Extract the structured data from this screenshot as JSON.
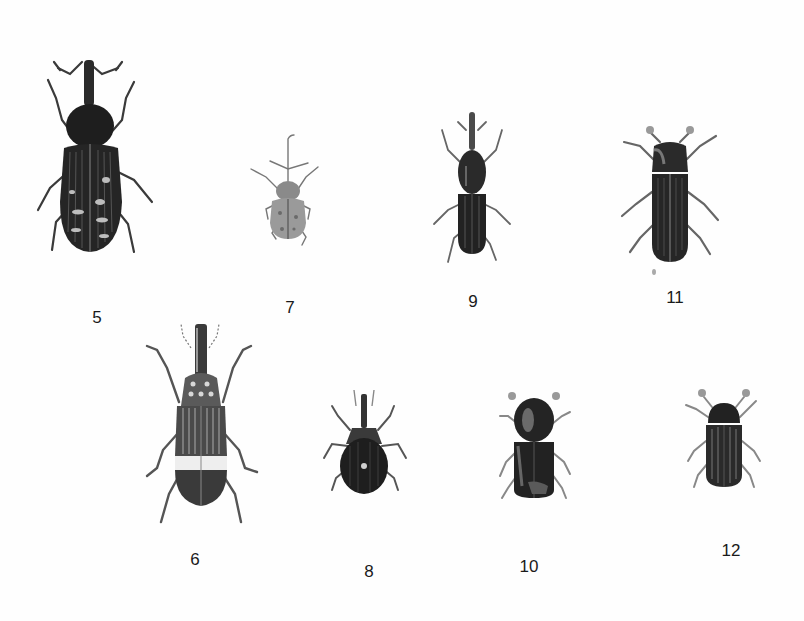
{
  "plate": {
    "background": "#ffffff",
    "ink_color": "#1a1a1a",
    "specimens": [
      {
        "number": "5",
        "kind": "weevil-long-snout-spotted",
        "label_x": 97,
        "label_y": 309
      },
      {
        "number": "7",
        "kind": "weevil-small-grey",
        "label_x": 290,
        "label_y": 299
      },
      {
        "number": "9",
        "kind": "weevil-slender-dark",
        "label_x": 473,
        "label_y": 293
      },
      {
        "number": "11",
        "kind": "bark-beetle-dark",
        "label_x": 675,
        "label_y": 289
      },
      {
        "number": "6",
        "kind": "weevil-striped-banded",
        "label_x": 195,
        "label_y": 551
      },
      {
        "number": "8",
        "kind": "weevil-round-dark",
        "label_x": 369,
        "label_y": 563
      },
      {
        "number": "10",
        "kind": "bark-beetle-cylindrical",
        "label_x": 529,
        "label_y": 558
      },
      {
        "number": "12",
        "kind": "bark-beetle-small",
        "label_x": 731,
        "label_y": 542
      }
    ]
  }
}
